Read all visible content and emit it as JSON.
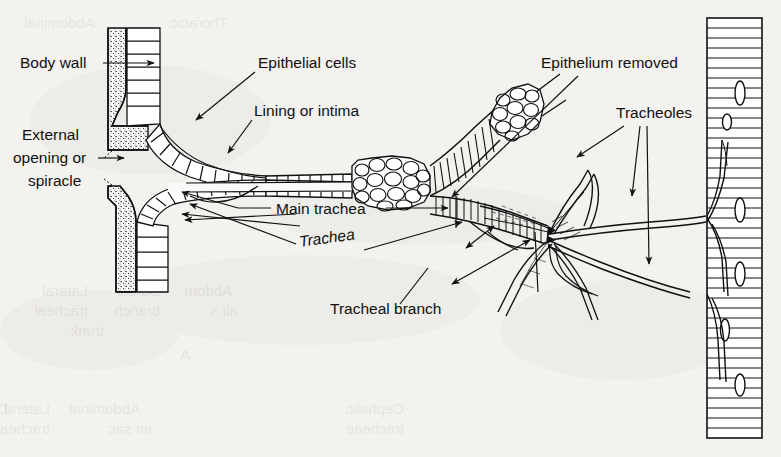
{
  "figure": {
    "background_color": "#f3f2ef",
    "ink_color": "#111111"
  },
  "labels": [
    {
      "id": "body-wall",
      "text": "Body wall",
      "x": 20,
      "y": 68,
      "style": "normal",
      "anchor": "start"
    },
    {
      "id": "external-opening-1",
      "text": "External",
      "x": 22,
      "y": 140,
      "style": "normal",
      "anchor": "start"
    },
    {
      "id": "external-opening-2",
      "text": "opening or",
      "x": 13,
      "y": 163,
      "style": "normal",
      "anchor": "start"
    },
    {
      "id": "external-opening-3",
      "text": "spiracle",
      "x": 28,
      "y": 186,
      "style": "normal",
      "anchor": "start"
    },
    {
      "id": "epithelial-cells",
      "text": "Epithelial cells",
      "x": 258,
      "y": 68,
      "style": "normal",
      "anchor": "start"
    },
    {
      "id": "lining-or-intima",
      "text": "Lining or intima",
      "x": 254,
      "y": 116,
      "style": "normal",
      "anchor": "start"
    },
    {
      "id": "epithelium-removed",
      "text": "Epithelium removed",
      "x": 541,
      "y": 68,
      "style": "normal",
      "anchor": "start"
    },
    {
      "id": "tracheoles",
      "text": "Tracheoles",
      "x": 616,
      "y": 118,
      "style": "normal",
      "anchor": "start"
    },
    {
      "id": "main-trachea",
      "text": "Main trachea",
      "x": 276,
      "y": 214,
      "style": "normal",
      "anchor": "start"
    },
    {
      "id": "trachea",
      "text": "Trachea",
      "x": 300,
      "y": 247,
      "style": "italic",
      "anchor": "start",
      "rotate": -8
    },
    {
      "id": "tracheal-branch",
      "text": "Tracheal branch",
      "x": 330,
      "y": 314,
      "style": "normal",
      "anchor": "start"
    }
  ],
  "ghost_text": [
    {
      "text": "Abdominal",
      "x": 95,
      "y": 28
    },
    {
      "text": "Thoracic",
      "x": 228,
      "y": 28
    },
    {
      "text": "Lateral",
      "x": 88,
      "y": 296
    },
    {
      "text": "tracheal",
      "x": 88,
      "y": 316
    },
    {
      "text": "trunk",
      "x": 104,
      "y": 336
    },
    {
      "text": "Dorsal",
      "x": 160,
      "y": 296
    },
    {
      "text": "branch",
      "x": 160,
      "y": 316
    },
    {
      "text": "Abdom",
      "x": 232,
      "y": 296
    },
    {
      "text": "air s",
      "x": 238,
      "y": 316
    },
    {
      "text": "A",
      "x": 190,
      "y": 360
    },
    {
      "text": "Abdominal",
      "x": 140,
      "y": 414
    },
    {
      "text": "air sac",
      "x": 152,
      "y": 434
    },
    {
      "text": "Lateral",
      "x": 50,
      "y": 414
    },
    {
      "text": "tracheal",
      "x": 50,
      "y": 434
    },
    {
      "text": "De",
      "x": 8,
      "y": 414
    },
    {
      "text": "Cephalic",
      "x": 404,
      "y": 414
    },
    {
      "text": "tracheae",
      "x": 404,
      "y": 434
    }
  ],
  "structures": {
    "body_wall": "stippled cuticular body wall, vertical at left with spiracle opening",
    "spiracle": "external opening through the body wall at mid-left",
    "epithelium": "single layer of rectangular epithelial cells lining trachea",
    "intima": "cuticular lining of the tracheal tube",
    "main_trachea": "wide horizontal tube from spiracle to branch point",
    "tracheal_branch": "narrowing tube with taenidial ridges leading to tracheoles",
    "tracheoles": "fine double-walled tubules radiating to the muscle",
    "muscle": "striated muscle block at right with lens-shaped nuclei",
    "cell_cluster": "cluster of rounded tracheal end cells"
  }
}
